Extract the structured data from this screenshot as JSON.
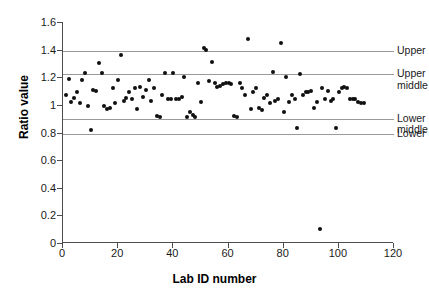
{
  "chart_data": {
    "type": "scatter",
    "title": "",
    "xlabel": "Lab ID number",
    "ylabel": "Ratio value",
    "xlim": [
      0,
      120
    ],
    "ylim": [
      0,
      1.6
    ],
    "xticks": [
      0,
      20,
      40,
      60,
      80,
      100,
      120
    ],
    "yticks": [
      "0",
      "0.2",
      "0.4",
      "0.6",
      "0.8",
      "1",
      "1.2",
      "1.4",
      "1.6"
    ],
    "ytick_values": [
      0,
      0.2,
      0.4,
      0.6,
      0.8,
      1.0,
      1.2,
      1.4,
      1.6
    ],
    "grid": "horizontal reference lines only",
    "legend_position": "right-outside",
    "marker": {
      "shape": "circle",
      "color": "#101010",
      "size": 4
    },
    "reference_lines": [
      {
        "label": "Upper",
        "value": 1.39
      },
      {
        "label": "Upper middle",
        "value": 1.22
      },
      {
        "label": "Lower middle",
        "value": 0.9
      },
      {
        "label": "Lower",
        "value": 0.79
      }
    ],
    "series": [
      {
        "name": "Lab ratio",
        "points": [
          [
            1,
            1.07
          ],
          [
            2,
            1.19
          ],
          [
            3,
            1.02
          ],
          [
            4,
            1.05
          ],
          [
            5,
            1.09
          ],
          [
            6,
            1.01
          ],
          [
            7,
            1.18
          ],
          [
            8,
            1.23
          ],
          [
            9,
            0.99
          ],
          [
            10,
            0.82
          ],
          [
            11,
            1.11
          ],
          [
            12,
            1.1
          ],
          [
            13,
            1.3
          ],
          [
            14,
            1.23
          ],
          [
            15,
            0.99
          ],
          [
            16,
            0.97
          ],
          [
            17,
            0.98
          ],
          [
            18,
            1.12
          ],
          [
            19,
            1.01
          ],
          [
            20,
            1.18
          ],
          [
            21,
            1.36
          ],
          [
            22,
            1.03
          ],
          [
            23,
            1.05
          ],
          [
            24,
            1.09
          ],
          [
            25,
            1.04
          ],
          [
            26,
            1.12
          ],
          [
            27,
            0.97
          ],
          [
            28,
            1.13
          ],
          [
            29,
            1.06
          ],
          [
            30,
            1.11
          ],
          [
            31,
            1.18
          ],
          [
            32,
            1.03
          ],
          [
            33,
            1.12
          ],
          [
            34,
            0.92
          ],
          [
            35,
            0.91
          ],
          [
            36,
            1.07
          ],
          [
            37,
            1.23
          ],
          [
            38,
            1.04
          ],
          [
            39,
            1.04
          ],
          [
            40,
            1.23
          ],
          [
            41,
            1.04
          ],
          [
            42,
            1.04
          ],
          [
            43,
            1.06
          ],
          [
            44,
            1.2
          ],
          [
            45,
            0.91
          ],
          [
            46,
            0.95
          ],
          [
            47,
            0.93
          ],
          [
            48,
            0.91
          ],
          [
            49,
            1.16
          ],
          [
            50,
            1.02
          ],
          [
            51,
            1.41
          ],
          [
            52,
            1.4
          ],
          [
            53,
            1.17
          ],
          [
            54,
            1.31
          ],
          [
            55,
            1.16
          ],
          [
            56,
            1.13
          ],
          [
            57,
            1.14
          ],
          [
            58,
            1.15
          ],
          [
            59,
            1.16
          ],
          [
            60,
            1.16
          ],
          [
            61,
            1.15
          ],
          [
            62,
            0.92
          ],
          [
            63,
            0.91
          ],
          [
            64,
            1.16
          ],
          [
            65,
            1.12
          ],
          [
            66,
            1.07
          ],
          [
            67,
            1.48
          ],
          [
            68,
            0.97
          ],
          [
            69,
            1.09
          ],
          [
            70,
            1.12
          ],
          [
            71,
            0.98
          ],
          [
            72,
            0.96
          ],
          [
            73,
            1.05
          ],
          [
            74,
            1.07
          ],
          [
            75,
            1.01
          ],
          [
            76,
            1.24
          ],
          [
            77,
            1.03
          ],
          [
            78,
            1.04
          ],
          [
            79,
            1.45
          ],
          [
            80,
            0.95
          ],
          [
            81,
            1.2
          ],
          [
            82,
            1.02
          ],
          [
            83,
            1.07
          ],
          [
            84,
            1.04
          ],
          [
            85,
            0.83
          ],
          [
            86,
            1.22
          ],
          [
            87,
            1.07
          ],
          [
            88,
            1.09
          ],
          [
            89,
            1.09
          ],
          [
            90,
            1.1
          ],
          [
            91,
            0.98
          ],
          [
            92,
            1.02
          ],
          [
            93,
            0.1
          ],
          [
            94,
            1.12
          ],
          [
            95,
            1.04
          ],
          [
            96,
            1.1
          ],
          [
            97,
            1.03
          ],
          [
            98,
            1.04
          ],
          [
            99,
            0.83
          ],
          [
            100,
            1.09
          ],
          [
            101,
            1.12
          ],
          [
            102,
            1.13
          ],
          [
            103,
            1.12
          ],
          [
            104,
            1.04
          ],
          [
            105,
            1.04
          ],
          [
            106,
            1.04
          ],
          [
            107,
            1.02
          ],
          [
            108,
            1.01
          ],
          [
            109,
            1.01
          ]
        ]
      }
    ]
  }
}
